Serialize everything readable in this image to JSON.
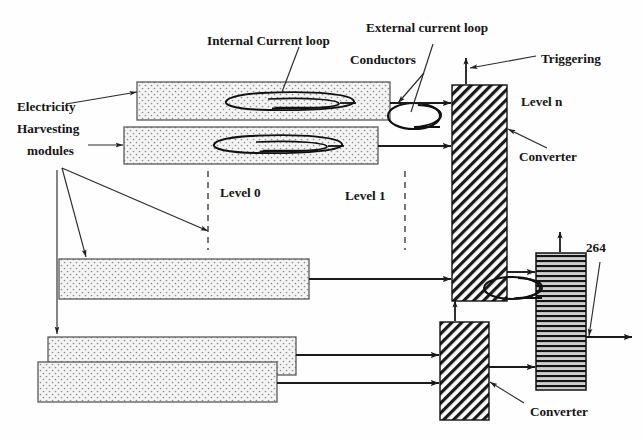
{
  "figure": {
    "type": "block-diagram",
    "width": 642,
    "height": 442,
    "background_color": "#fefefe",
    "line_color": "#1a1a1a"
  },
  "labels": {
    "electricity_harvesting_modules": "Electricity\nHarvesting\n modules",
    "electricity_line1": "Electricity",
    "electricity_line2": "Harvesting",
    "electricity_line3": "modules",
    "internal_current_loop": "Internal Current loop",
    "external_current_loop": "External current loop",
    "conductors": "Conductors",
    "triggering": "Triggering",
    "level_0": "Level 0",
    "level_1": "Level 1",
    "level_n": "Level n",
    "converter_top": "Converter",
    "converter_bottom": "Converter",
    "reference_264": "264"
  },
  "colors": {
    "module_fill": "#f2f2f2",
    "module_dot": "#8a8a8a",
    "module_stroke": "#555555",
    "converter_hatch": "#1a1a1a",
    "converter_fill": "#ffffff",
    "striped_block_fill": "#c8c8c8",
    "striped_block_line": "#141414",
    "text": "#151515",
    "arrow": "#1a1a1a",
    "dashed_divider": "#4a4a4a"
  },
  "blocks": {
    "harvesting_modules": [
      {
        "name": "module-level0-row1",
        "x": 137,
        "y": 82,
        "w": 253,
        "h": 38,
        "has_internal_loop": true
      },
      {
        "name": "module-level0-row2",
        "x": 124,
        "y": 127,
        "w": 254,
        "h": 37,
        "has_internal_loop": true
      },
      {
        "name": "module-lower-row1",
        "x": 59,
        "y": 259,
        "w": 250,
        "h": 40,
        "has_internal_loop": false
      },
      {
        "name": "module-lower-row2",
        "x": 48,
        "y": 337,
        "w": 248,
        "h": 38,
        "has_internal_loop": false
      },
      {
        "name": "module-lower-row3",
        "x": 38,
        "y": 362,
        "w": 239,
        "h": 40,
        "has_internal_loop": false
      }
    ],
    "converters": [
      {
        "name": "converter-level-n",
        "x": 452,
        "y": 85,
        "w": 55,
        "h": 216,
        "hatch": "diagonal"
      },
      {
        "name": "converter-lower",
        "x": 440,
        "y": 322,
        "w": 49,
        "h": 98,
        "hatch": "diagonal"
      }
    ],
    "striped_output_block": {
      "name": "output-block-264",
      "x": 536,
      "y": 253,
      "w": 50,
      "h": 137,
      "hatch": "horizontal"
    }
  },
  "current_loops": {
    "internal": [
      {
        "name": "internal-loop-row1",
        "cx": 266,
        "cy": 101
      },
      {
        "name": "internal-loop-row2",
        "cx": 253,
        "cy": 145
      }
    ],
    "external": [
      {
        "name": "external-loop-top",
        "cx": 415,
        "cy": 115
      },
      {
        "name": "external-loop-bottom",
        "cx": 513,
        "cy": 288
      }
    ]
  },
  "dividers": [
    {
      "name": "divider-level-0",
      "x": 208,
      "y1": 172,
      "y2": 250
    },
    {
      "name": "divider-level-1",
      "x": 405,
      "y1": 172,
      "y2": 250
    }
  ]
}
